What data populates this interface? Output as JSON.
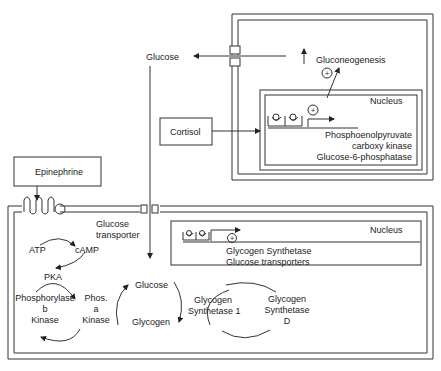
{
  "diagram": {
    "hormones": {
      "epinephrine": "Epinephrine",
      "cortisol": "Cortisol"
    },
    "liver_cell": {
      "glucose_out": "Glucose",
      "gluconeogenesis": "Gluconeogenesis",
      "nucleus": "Nucleus",
      "genes": [
        "Phosphoenolpyruvate",
        "carboxy kinase",
        "Glucose-6-phosphatase"
      ],
      "plus": "+"
    },
    "muscle_cell": {
      "transporter_label": [
        "Glucose",
        "transporter"
      ],
      "atp": "ATP",
      "camp": "cAMP",
      "pka": "PKA",
      "phosphorylase_b": [
        "Phosphorylase",
        "b",
        "Kinase"
      ],
      "phos_a": [
        "Phos.",
        "a",
        "Kinase"
      ],
      "glucose": "Glucose",
      "glycogen": "Glycogen",
      "glycogen_synthetase_1": [
        "Glycogen",
        "Synthetase 1"
      ],
      "glycogen_synthetase_d": [
        "Glycogen",
        "Synthetase",
        "D"
      ],
      "nucleus": "Nucleus",
      "genes": [
        "Glycogen Synthetase",
        "Glucose transporters"
      ],
      "plus": "+"
    }
  }
}
